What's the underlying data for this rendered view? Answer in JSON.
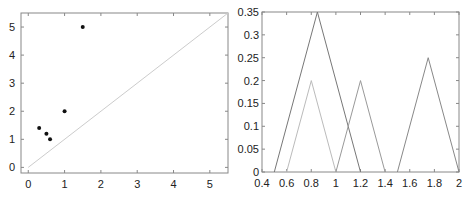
{
  "chart_data": [
    {
      "type": "scatter",
      "title": "",
      "xlabel": "",
      "ylabel": "",
      "xlim": [
        -0.2,
        5.5
      ],
      "ylim": [
        -0.2,
        5.5
      ],
      "grid": false,
      "x_ticks": [
        "0",
        "1",
        "2",
        "3",
        "4",
        "5"
      ],
      "y_ticks": [
        "0",
        "1",
        "2",
        "3",
        "4",
        "5"
      ],
      "series": [
        {
          "name": "points",
          "marker": "dot",
          "color": "#111111",
          "x": [
            0.3,
            0.5,
            0.6,
            1.0,
            1.5
          ],
          "y": [
            1.4,
            1.2,
            1.0,
            2.0,
            5.0
          ]
        },
        {
          "name": "diagonal",
          "type": "line",
          "color": "#cccccc",
          "x": [
            0,
            5.5
          ],
          "y": [
            0,
            5.5
          ]
        }
      ]
    },
    {
      "type": "line",
      "title": "",
      "xlabel": "",
      "ylabel": "",
      "xlim": [
        0.4,
        2.0
      ],
      "ylim": [
        0,
        0.35
      ],
      "grid": false,
      "x_ticks": [
        "0.4",
        "0.6",
        "0.8",
        "1",
        "1.2",
        "1.4",
        "1.6",
        "1.8",
        "2"
      ],
      "y_ticks": [
        "0",
        "0.05",
        "0.1",
        "0.15",
        "0.2",
        "0.25",
        "0.3",
        "0.35"
      ],
      "series": [
        {
          "name": "triangle-1",
          "color": "#777777",
          "x": [
            0.5,
            0.85,
            1.2
          ],
          "y": [
            0,
            0.35,
            0
          ]
        },
        {
          "name": "triangle-2",
          "color": "#bbbbbb",
          "x": [
            0.6,
            0.8,
            1.0
          ],
          "y": [
            0,
            0.2,
            0
          ]
        },
        {
          "name": "triangle-3",
          "color": "#999999",
          "x": [
            1.0,
            1.2,
            1.4
          ],
          "y": [
            0,
            0.2,
            0
          ]
        },
        {
          "name": "triangle-4",
          "color": "#888888",
          "x": [
            1.5,
            1.75,
            2.0
          ],
          "y": [
            0,
            0.25,
            0
          ]
        }
      ]
    }
  ]
}
